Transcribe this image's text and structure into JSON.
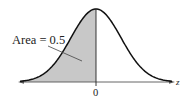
{
  "chart_data": {
    "type": "area",
    "title": "",
    "xlabel": "z",
    "ylabel": "",
    "x_ticks": [
      "0"
    ],
    "annotations": [
      {
        "text": "Area = 0.5",
        "points_to": "shaded region left of z = 0"
      }
    ],
    "shaded_region": {
      "from": "-inf",
      "to": 0,
      "area": 0.5
    },
    "distribution": {
      "mean": 0,
      "sd": 1
    },
    "grid": false,
    "legend": null
  },
  "labels": {
    "area_annotation": "Area = 0.5",
    "axis_label": "z",
    "tick_zero": "0"
  },
  "colors": {
    "curve": "#111111",
    "shade": "#c8c8c8",
    "axis": "#444444",
    "text": "#222222"
  }
}
